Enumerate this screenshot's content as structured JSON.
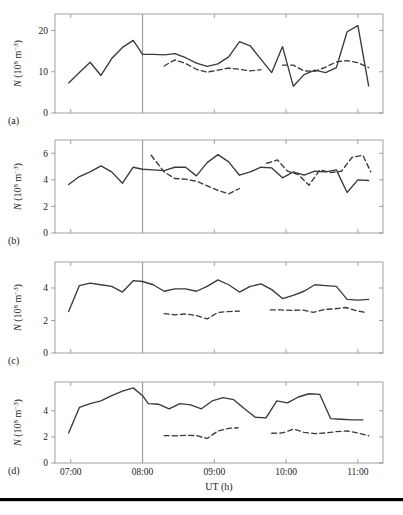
{
  "figure": {
    "name": "multi-panel-time-series",
    "x_axis_title": "UT (h)",
    "y_axis_title_parts": {
      "symbol": "N",
      "open": " (10",
      "exp1": "8",
      "mid": " m",
      "exp2": "−3",
      "close": ")"
    },
    "y_axis_title_plain": "N (10⁸ m⁻³)",
    "x_tick_labels": [
      "07:00",
      "08:00",
      "09:00",
      "10:00",
      "11:00"
    ],
    "x_tick_values": [
      7,
      8,
      9,
      10,
      11
    ],
    "xlim": [
      6.78,
      11.35
    ],
    "marker_line_time": "08:00",
    "marker_line_value": 8,
    "colors": {
      "solid_line": "#3a3a3a",
      "dashed_line": "#3a3a3a",
      "axis": "#8a8a8a",
      "marker_line": "#9a9a9a",
      "text": "#1a1a1a",
      "bottom_rule": "#000000",
      "background": "#ffffff"
    },
    "legend": {
      "solid_series_name": "solid",
      "dashed_series_name": "dashed"
    },
    "bottom_rule_present": true
  },
  "chart_data": [
    {
      "type": "line",
      "panel": "a",
      "panel_label": "(a)",
      "title": "",
      "xlabel": "",
      "ylabel": "N (10⁸ m⁻³)",
      "xlim": [
        6.78,
        11.35
      ],
      "ylim": [
        0,
        24
      ],
      "yticks": [
        0,
        10,
        20
      ],
      "xticks": [
        7,
        8,
        9,
        10,
        11
      ],
      "grid": false,
      "series": [
        {
          "name": "solid",
          "style": "solid",
          "x": [
            6.97,
            7.12,
            7.27,
            7.42,
            7.57,
            7.72,
            7.87,
            8.0,
            8.15,
            8.3,
            8.45,
            8.6,
            8.75,
            8.9,
            9.05,
            9.2,
            9.35,
            9.5,
            9.65,
            9.8,
            9.95,
            10.1,
            10.25,
            10.4,
            10.55,
            10.7,
            10.85,
            11.0,
            11.15
          ],
          "y": [
            7.3,
            9.8,
            12.3,
            9.1,
            13.2,
            15.9,
            17.6,
            14.2,
            14.2,
            14.1,
            14.4,
            13.4,
            12.1,
            11.3,
            11.9,
            13.6,
            17.3,
            16.3,
            13.0,
            9.8,
            16.1,
            6.5,
            9.3,
            10.4,
            9.8,
            11.0,
            19.7,
            21.2,
            6.6,
            5.7,
            8.3
          ]
        },
        {
          "name": "dashed",
          "style": "dashed",
          "segments": [
            {
              "x": [
                8.3,
                8.45,
                8.6,
                8.75,
                8.9,
                9.05,
                9.2,
                9.35,
                9.5,
                9.65
              ],
              "y": [
                11.4,
                12.9,
                12.0,
                10.6,
                9.9,
                10.4,
                10.9,
                10.6,
                10.2,
                10.5
              ]
            },
            {
              "x": [
                9.95,
                10.1,
                10.25,
                10.4,
                10.55,
                10.7,
                10.85,
                11.0,
                11.15
              ],
              "y": [
                11.6,
                11.6,
                10.2,
                10.1,
                11.1,
                12.4,
                12.7,
                12.2,
                11.0
              ]
            }
          ]
        }
      ]
    },
    {
      "type": "line",
      "panel": "b",
      "panel_label": "(b)",
      "title": "",
      "xlabel": "",
      "ylabel": "N (10⁸ m⁻³)",
      "xlim": [
        6.78,
        11.35
      ],
      "ylim": [
        0,
        7
      ],
      "yticks": [
        0,
        2,
        4,
        6
      ],
      "xticks": [
        7,
        8,
        9,
        10,
        11
      ],
      "grid": false,
      "series": [
        {
          "name": "solid",
          "style": "solid",
          "x": [
            6.97,
            7.12,
            7.27,
            7.42,
            7.57,
            7.72,
            7.87,
            8.0,
            8.15,
            8.3,
            8.45,
            8.6,
            8.75,
            8.9,
            9.05,
            9.2,
            9.35,
            9.5,
            9.65,
            9.8,
            9.95,
            10.1,
            10.25,
            10.4,
            10.55,
            10.7,
            10.85,
            11.0,
            11.15
          ],
          "y": [
            3.65,
            4.25,
            4.6,
            5.05,
            4.6,
            3.75,
            4.95,
            4.8,
            4.75,
            4.7,
            4.95,
            4.95,
            4.3,
            5.3,
            5.9,
            5.35,
            4.35,
            4.6,
            4.95,
            4.9,
            4.15,
            4.6,
            4.35,
            4.65,
            4.6,
            4.75,
            3.05,
            4.0,
            3.95,
            4.25
          ]
        },
        {
          "name": "dashed",
          "style": "dashed",
          "segments": [
            {
              "x": [
                8.12,
                8.3,
                8.45,
                8.6,
                8.75,
                8.9,
                9.05,
                9.2,
                9.35
              ],
              "y": [
                5.85,
                4.6,
                4.1,
                4.05,
                3.9,
                3.55,
                3.2,
                2.95,
                3.35
              ]
            },
            {
              "x": [
                9.73,
                9.88,
                10.02,
                10.17,
                10.32,
                10.47,
                10.62,
                10.77,
                10.92,
                11.07,
                11.18
              ],
              "y": [
                5.25,
                5.5,
                4.65,
                4.4,
                3.6,
                4.75,
                4.55,
                4.65,
                5.7,
                5.85,
                4.6
              ]
            }
          ]
        }
      ]
    },
    {
      "type": "line",
      "panel": "c",
      "panel_label": "(c)",
      "title": "",
      "xlabel": "",
      "ylabel": "N (10⁸ m⁻³)",
      "xlim": [
        6.78,
        11.35
      ],
      "ylim": [
        0,
        5.6
      ],
      "yticks": [
        0,
        2,
        4
      ],
      "xticks": [
        7,
        8,
        9,
        10,
        11
      ],
      "grid": false,
      "series": [
        {
          "name": "solid",
          "style": "solid",
          "x": [
            6.97,
            7.12,
            7.27,
            7.42,
            7.57,
            7.72,
            7.87,
            8.0,
            8.15,
            8.3,
            8.45,
            8.6,
            8.75,
            8.9,
            9.05,
            9.2,
            9.35,
            9.5,
            9.65,
            9.8,
            9.95,
            10.1,
            10.25,
            10.4,
            10.55,
            10.7,
            10.85,
            11.0,
            11.15
          ],
          "y": [
            2.55,
            4.15,
            4.3,
            4.2,
            4.1,
            3.75,
            4.45,
            4.4,
            4.2,
            3.8,
            3.95,
            3.95,
            3.8,
            4.1,
            4.5,
            4.2,
            3.75,
            4.1,
            4.25,
            3.9,
            3.35,
            3.55,
            3.8,
            4.2,
            4.15,
            4.1,
            3.3,
            3.25,
            3.3,
            3.25
          ]
        },
        {
          "name": "dashed",
          "style": "dashed",
          "segments": [
            {
              "x": [
                8.3,
                8.45,
                8.6,
                8.75,
                8.9,
                9.05,
                9.2,
                9.35
              ],
              "y": [
                2.42,
                2.35,
                2.4,
                2.3,
                2.1,
                2.5,
                2.55,
                2.58
              ]
            },
            {
              "x": [
                9.78,
                9.93,
                10.08,
                10.23,
                10.38,
                10.53,
                10.68,
                10.83,
                10.98,
                11.13
              ],
              "y": [
                2.65,
                2.65,
                2.62,
                2.65,
                2.5,
                2.68,
                2.72,
                2.8,
                2.6,
                2.48
              ]
            }
          ]
        }
      ]
    },
    {
      "type": "line",
      "panel": "d",
      "panel_label": "(d)",
      "title": "",
      "xlabel": "UT (h)",
      "ylabel": "N (10⁸ m⁻³)",
      "xlim": [
        6.78,
        11.35
      ],
      "ylim": [
        0,
        6.2
      ],
      "yticks": [
        0,
        2,
        4
      ],
      "xticks": [
        7,
        8,
        9,
        10,
        11
      ],
      "grid": false,
      "series": [
        {
          "name": "solid",
          "style": "solid",
          "x": [
            6.97,
            7.12,
            7.27,
            7.42,
            7.57,
            7.72,
            7.87,
            8.0,
            8.08,
            8.22,
            8.37,
            8.52,
            8.67,
            8.82,
            8.97,
            9.12,
            9.27,
            9.42,
            9.57,
            9.72,
            9.87,
            10.02,
            10.17,
            10.32,
            10.47,
            10.62,
            10.77,
            10.92,
            11.07,
            11.18
          ],
          "y": [
            2.3,
            4.25,
            4.55,
            4.75,
            5.15,
            5.5,
            5.75,
            5.15,
            4.55,
            4.5,
            4.15,
            4.55,
            4.45,
            4.15,
            4.75,
            5.0,
            4.85,
            4.15,
            3.5,
            3.45,
            4.75,
            4.6,
            5.05,
            5.3,
            5.25,
            3.4,
            3.35,
            3.3,
            3.3
          ]
        },
        {
          "name": "dashed",
          "style": "dashed",
          "segments": [
            {
              "x": [
                8.3,
                8.45,
                8.6,
                8.75,
                8.9,
                9.05,
                9.2,
                9.33
              ],
              "y": [
                2.1,
                2.08,
                2.12,
                2.1,
                1.88,
                2.45,
                2.65,
                2.7
              ]
            },
            {
              "x": [
                9.8,
                9.95,
                10.1,
                10.25,
                10.4,
                10.55,
                10.7,
                10.85,
                11.0,
                11.15
              ],
              "y": [
                2.28,
                2.3,
                2.6,
                2.35,
                2.25,
                2.3,
                2.4,
                2.45,
                2.3,
                2.08
              ]
            }
          ]
        }
      ]
    }
  ]
}
